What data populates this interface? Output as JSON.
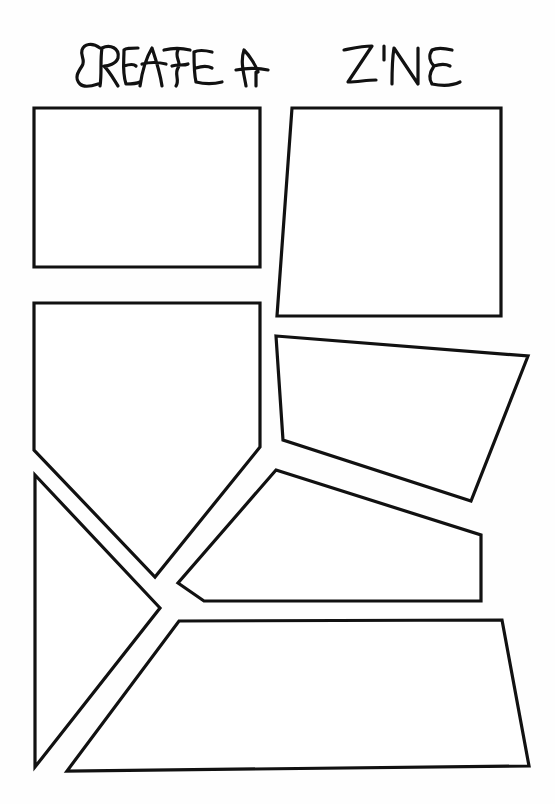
{
  "title": {
    "text": "CREATE A ZINE",
    "style": "hand-drawn lettering"
  },
  "colors": {
    "background": "#ffffff",
    "stroke": "#111111"
  },
  "panels": [
    {
      "id": "panel-1",
      "shape": "rectangle",
      "points": "34,108 260,108 260,267 34,267"
    },
    {
      "id": "panel-2",
      "shape": "quadrilateral",
      "points": "292,108 501,108 501,316 277,316"
    },
    {
      "id": "panel-3",
      "shape": "pentagon",
      "points": "34,303 260,303 260,447 155,577 34,450"
    },
    {
      "id": "panel-4",
      "shape": "quadrilateral",
      "points": "276,336 528,356 471,501 283,440"
    },
    {
      "id": "panel-5",
      "shape": "pentagon",
      "points": "276,470 481,535 481,601 204,601 178,583"
    },
    {
      "id": "panel-6",
      "shape": "triangle",
      "points": "35,475 160,608 35,767"
    },
    {
      "id": "panel-7",
      "shape": "trapezoid",
      "points": "179,621 502,620 529,766 67,771"
    }
  ]
}
